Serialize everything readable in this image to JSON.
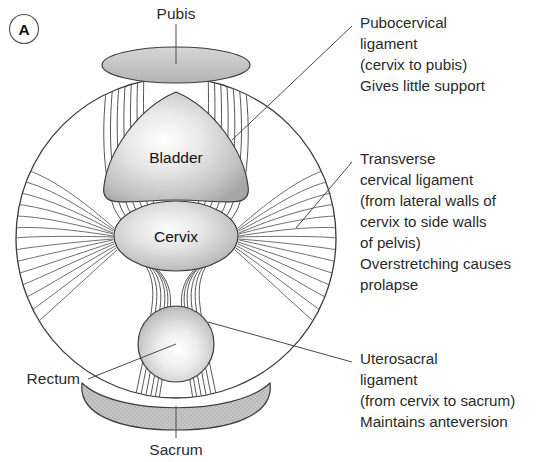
{
  "figure": {
    "panel_label": "A",
    "organs": [
      {
        "name": "bladder",
        "label": "Bladder"
      },
      {
        "name": "cervix",
        "label": "Cervix"
      }
    ],
    "bone_labels": [
      {
        "name": "pubis",
        "label": "Pubis"
      },
      {
        "name": "sacrum",
        "label": "Sacrum"
      }
    ],
    "structure_labels": [
      {
        "name": "rectum",
        "label": "Rectum"
      }
    ],
    "annotations": [
      {
        "name": "pubocervical-ligament",
        "lines": [
          "Pubocervical",
          "ligament",
          "(cervix to pubis)",
          "Gives little support"
        ]
      },
      {
        "name": "transverse-cervical-ligament",
        "lines": [
          "Transverse",
          "cervical ligament",
          "(from lateral walls of",
          "cervix to side walls",
          "of pelvis)",
          "Overstretching causes",
          "prolapse"
        ]
      },
      {
        "name": "uterosacral-ligament",
        "lines": [
          "Uterosacral",
          "ligament",
          "(from cervix to sacrum)",
          "Maintains anteversion"
        ]
      }
    ],
    "colors": {
      "background": "#ffffff",
      "outline": "#3c3c3c",
      "fiber": "#4d4d4d",
      "leader": "#4a4a4a",
      "text": "#2b2b2b",
      "bone_fill": "#c9c9c9",
      "organ_light": "#ffffff",
      "organ_dark": "#a9a9a9"
    }
  }
}
